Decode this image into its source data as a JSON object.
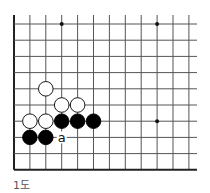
{
  "diagram": {
    "caption": "1도",
    "board": {
      "origin_x": 14,
      "origin_y": 24,
      "col_spacing": 15.9,
      "row_spacing": 16.2,
      "cols": 12,
      "rows": 10,
      "line_top": 15,
      "line_right": 197,
      "left_edge": true,
      "bottom_edge": true,
      "line_color": "#555555",
      "edge_color": "#222222"
    },
    "star_points": [
      {
        "col": 3,
        "row": 0
      },
      {
        "col": 9,
        "row": 0
      },
      {
        "col": 9,
        "row": 6
      }
    ],
    "stones": [
      {
        "color": "white",
        "col": 2,
        "row": 4
      },
      {
        "color": "white",
        "col": 3,
        "row": 5
      },
      {
        "color": "white",
        "col": 4,
        "row": 5
      },
      {
        "color": "white",
        "col": 1,
        "row": 6
      },
      {
        "color": "white",
        "col": 2,
        "row": 6
      },
      {
        "color": "black",
        "col": 3,
        "row": 6
      },
      {
        "color": "black",
        "col": 4,
        "row": 6
      },
      {
        "color": "black",
        "col": 5,
        "row": 6
      },
      {
        "color": "black",
        "col": 1,
        "row": 7
      },
      {
        "color": "black",
        "col": 2,
        "row": 7
      }
    ],
    "labels": [
      {
        "text": "a",
        "col": 3,
        "row": 7
      }
    ]
  }
}
